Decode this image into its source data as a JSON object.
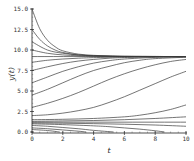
{
  "chart_data": {
    "type": "line",
    "title": "",
    "xlabel": "t",
    "ylabel": "y(t)",
    "xlim": [
      0,
      10
    ],
    "ylim": [
      0,
      15
    ],
    "x_ticks": [
      "0",
      "2",
      "4",
      "6",
      "8",
      "10"
    ],
    "y_ticks": [
      "0.0",
      "2.5",
      "5.0",
      "7.5",
      "10.0",
      "12.5",
      "15.0"
    ],
    "grid": false,
    "legend": null,
    "equilibria": [
      9.2,
      1.2
    ],
    "series": [
      {
        "name": "y0=15.0",
        "x": [
          0,
          0.5,
          1,
          1.5,
          2,
          3,
          4,
          5,
          6,
          8,
          10
        ],
        "values": [
          15.0,
          12.6,
          11.2,
          10.4,
          9.9,
          9.5,
          9.35,
          9.27,
          9.23,
          9.21,
          9.2
        ]
      },
      {
        "name": "y0=12.5",
        "x": [
          0,
          0.5,
          1,
          1.5,
          2,
          3,
          4,
          5,
          6,
          8,
          10
        ],
        "values": [
          12.5,
          11.3,
          10.5,
          10.0,
          9.7,
          9.4,
          9.3,
          9.25,
          9.22,
          9.21,
          9.2
        ]
      },
      {
        "name": "y0=11.0",
        "x": [
          0,
          1,
          2,
          3,
          4,
          5,
          6,
          8,
          10
        ],
        "values": [
          11.0,
          10.0,
          9.6,
          9.4,
          9.3,
          9.25,
          9.22,
          9.21,
          9.2
        ]
      },
      {
        "name": "y0=10.0",
        "x": [
          0,
          1,
          2,
          3,
          4,
          6,
          8,
          10
        ],
        "values": [
          10.0,
          9.6,
          9.4,
          9.3,
          9.25,
          9.22,
          9.21,
          9.2
        ]
      },
      {
        "name": "y0=9.2",
        "x": [
          0,
          10
        ],
        "values": [
          9.2,
          9.2
        ]
      },
      {
        "name": "y0=8.5",
        "x": [
          0,
          1,
          2,
          3,
          4,
          6,
          8,
          10
        ],
        "values": [
          8.5,
          8.75,
          8.9,
          9.0,
          9.07,
          9.15,
          9.18,
          9.2
        ]
      },
      {
        "name": "y0=7.5",
        "x": [
          0,
          1,
          2,
          3,
          4,
          5,
          6,
          8,
          10
        ],
        "values": [
          7.5,
          7.95,
          8.35,
          8.65,
          8.85,
          9.0,
          9.08,
          9.16,
          9.19
        ]
      },
      {
        "name": "y0=6.0",
        "x": [
          0,
          1,
          2,
          3,
          4,
          5,
          6,
          8,
          10
        ],
        "values": [
          6.0,
          6.7,
          7.4,
          7.95,
          8.4,
          8.7,
          8.9,
          9.1,
          9.17
        ]
      },
      {
        "name": "y0=4.5",
        "x": [
          0,
          1,
          2,
          3,
          4,
          5,
          6,
          7,
          8,
          10
        ],
        "values": [
          4.5,
          5.2,
          6.0,
          6.8,
          7.5,
          8.0,
          8.45,
          8.75,
          8.95,
          9.12
        ]
      },
      {
        "name": "y0=3.0",
        "x": [
          0,
          1,
          2,
          3,
          4,
          5,
          6,
          7,
          8,
          9,
          10
        ],
        "values": [
          3.0,
          3.5,
          4.1,
          4.8,
          5.6,
          6.4,
          7.1,
          7.7,
          8.2,
          8.6,
          8.85
        ]
      },
      {
        "name": "y0=2.0",
        "x": [
          0,
          1,
          2,
          3,
          4,
          5,
          6,
          7,
          8,
          9,
          10
        ],
        "values": [
          2.0,
          2.1,
          2.3,
          2.6,
          3.0,
          3.6,
          4.3,
          5.1,
          5.9,
          6.7,
          7.4
        ]
      },
      {
        "name": "y0=1.5",
        "x": [
          0,
          2,
          4,
          6,
          7,
          8,
          9,
          10
        ],
        "values": [
          1.5,
          1.55,
          1.65,
          1.85,
          2.05,
          2.35,
          2.75,
          3.3
        ]
      },
      {
        "name": "y0=1.3",
        "x": [
          0,
          2,
          4,
          6,
          8,
          10
        ],
        "values": [
          1.3,
          1.35,
          1.4,
          1.5,
          1.65,
          1.85
        ]
      },
      {
        "name": "y0=1.2",
        "x": [
          0,
          10
        ],
        "values": [
          1.2,
          1.2
        ]
      },
      {
        "name": "y0=1.1",
        "x": [
          0,
          2,
          4,
          6,
          8,
          10
        ],
        "values": [
          1.1,
          1.07,
          1.02,
          0.95,
          0.85,
          0.7
        ]
      },
      {
        "name": "y0=1.0",
        "x": [
          0,
          2,
          4,
          5,
          6,
          7,
          8,
          8.6
        ],
        "values": [
          1.0,
          0.9,
          0.75,
          0.65,
          0.5,
          0.35,
          0.15,
          0.0
        ]
      },
      {
        "name": "y0=0.8",
        "x": [
          0,
          1,
          2,
          3,
          4,
          5.3
        ],
        "values": [
          0.8,
          0.7,
          0.55,
          0.4,
          0.2,
          0.0
        ]
      },
      {
        "name": "y0=0.5",
        "x": [
          0,
          1,
          2,
          3,
          3.5
        ],
        "values": [
          0.5,
          0.4,
          0.25,
          0.1,
          0.0
        ]
      },
      {
        "name": "y0=0.3",
        "x": [
          0,
          1,
          1.8
        ],
        "values": [
          0.3,
          0.18,
          0.0
        ]
      }
    ]
  }
}
